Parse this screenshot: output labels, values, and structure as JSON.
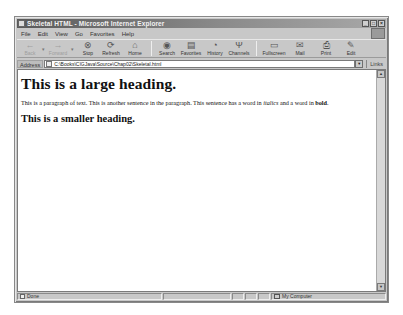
{
  "window": {
    "title": "Skeletal HTML - Microsoft Internet Explorer",
    "controls": [
      "_",
      "□",
      "×"
    ]
  },
  "menubar": {
    "items": [
      {
        "label": "File"
      },
      {
        "label": "Edit"
      },
      {
        "label": "View"
      },
      {
        "label": "Go"
      },
      {
        "label": "Favorites"
      },
      {
        "label": "Help"
      }
    ]
  },
  "toolbar": {
    "buttons": [
      {
        "label": "Back",
        "icon": "←",
        "enabled": false
      },
      {
        "label": "Forward",
        "icon": "→",
        "enabled": false
      },
      {
        "label": "Stop",
        "icon": "⊗",
        "enabled": true
      },
      {
        "label": "Refresh",
        "icon": "⟳",
        "enabled": true
      },
      {
        "label": "Home",
        "icon": "⌂",
        "enabled": true
      },
      {
        "label": "Search",
        "icon": "◉",
        "enabled": true
      },
      {
        "label": "Favorites",
        "icon": "▤",
        "enabled": true
      },
      {
        "label": "History",
        "icon": "◔",
        "enabled": true
      },
      {
        "label": "Channels",
        "icon": "Ψ",
        "enabled": true
      },
      {
        "label": "Fullscreen",
        "icon": "▭",
        "enabled": true
      },
      {
        "label": "Mail",
        "icon": "✉",
        "enabled": true
      },
      {
        "label": "Print",
        "icon": "⎙",
        "enabled": true
      },
      {
        "label": "Edit",
        "icon": "✎",
        "enabled": true
      }
    ],
    "dropdown_arrow": "▾"
  },
  "addressbar": {
    "label": "Address",
    "url": "C:\\Books\\CIGJava\\Source\\Chap02\\Skeletal.html",
    "dropdown": "▼",
    "links_label": "Links"
  },
  "page": {
    "heading1": "This is a large heading.",
    "paragraph": {
      "text_before_italic": "This is a paragraph of text. This is another sentence in the paragraph. This sentence has a word in ",
      "italic_word": "italics",
      "text_between": " and a word in ",
      "bold_word": "bold",
      "text_after": "."
    },
    "heading2": "This is a smaller heading."
  },
  "scrollbar": {
    "up": "▲",
    "down": "▼"
  },
  "statusbar": {
    "status": "Done",
    "zone": "My Computer"
  }
}
